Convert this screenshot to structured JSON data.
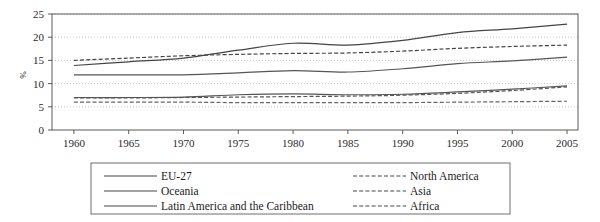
{
  "chart_data": {
    "type": "line",
    "title": "",
    "xlabel": "",
    "ylabel": "%",
    "xlim": [
      1958,
      2006
    ],
    "ylim": [
      0,
      25
    ],
    "grid": true,
    "grid_style": "dotted-horizontal",
    "legend_position": "bottom",
    "x_ticks": [
      1960,
      1965,
      1970,
      1975,
      1980,
      1985,
      1990,
      1995,
      2000,
      2005
    ],
    "y_ticks": [
      0,
      5,
      10,
      15,
      20,
      25
    ],
    "x": [
      1960,
      1965,
      1970,
      1975,
      1980,
      1985,
      1990,
      1995,
      2000,
      2005
    ],
    "series": [
      {
        "name": "EU-27",
        "style": "solid",
        "color": "#444444",
        "values": [
          13.9,
          14.7,
          15.5,
          17.2,
          18.7,
          18.3,
          19.3,
          21.0,
          21.8,
          22.8
        ]
      },
      {
        "name": "North America",
        "style": "dashed",
        "color": "#444444",
        "values": [
          15.0,
          15.5,
          16.0,
          16.3,
          16.5,
          16.6,
          17.0,
          17.6,
          18.0,
          18.3
        ]
      },
      {
        "name": "Oceania",
        "style": "solid",
        "color": "#555555",
        "values": [
          11.9,
          11.9,
          11.9,
          12.3,
          12.8,
          12.5,
          13.2,
          14.3,
          14.9,
          15.7
        ]
      },
      {
        "name": "Asia",
        "style": "dashed",
        "color": "#555555",
        "values": [
          6.9,
          6.9,
          7.0,
          7.1,
          7.2,
          7.3,
          7.5,
          7.9,
          8.5,
          9.3
        ]
      },
      {
        "name": "Latin America and the Caribbean",
        "style": "solid",
        "color": "#555555",
        "values": [
          7.0,
          7.0,
          7.1,
          7.6,
          7.8,
          7.6,
          7.7,
          8.2,
          8.8,
          9.5
        ]
      },
      {
        "name": "Africa",
        "style": "dashed",
        "color": "#666666",
        "values": [
          6.0,
          6.0,
          6.0,
          5.9,
          5.9,
          5.9,
          5.9,
          6.0,
          6.1,
          6.2
        ]
      }
    ]
  },
  "axes": {
    "y_label": "%",
    "y_tick_labels": [
      "0",
      "5",
      "10",
      "15",
      "20",
      "25"
    ],
    "x_tick_labels": [
      "1960",
      "1965",
      "1970",
      "1975",
      "1980",
      "1985",
      "1990",
      "1995",
      "2000",
      "2005"
    ]
  },
  "legend": {
    "column_left": [
      {
        "label": "EU-27",
        "style": "solid"
      },
      {
        "label": "Oceania",
        "style": "solid"
      },
      {
        "label": "Latin America and the Caribbean",
        "style": "solid"
      }
    ],
    "column_right": [
      {
        "label": "North America",
        "style": "dashed"
      },
      {
        "label": "Asia",
        "style": "dashed"
      },
      {
        "label": "Africa",
        "style": "dashed"
      }
    ]
  },
  "colors": {
    "axis": "#5a5a5a",
    "grid": "#b9b9b9",
    "line": "#474747",
    "legend_border": "#6f6f6f",
    "background": "#ffffff"
  }
}
